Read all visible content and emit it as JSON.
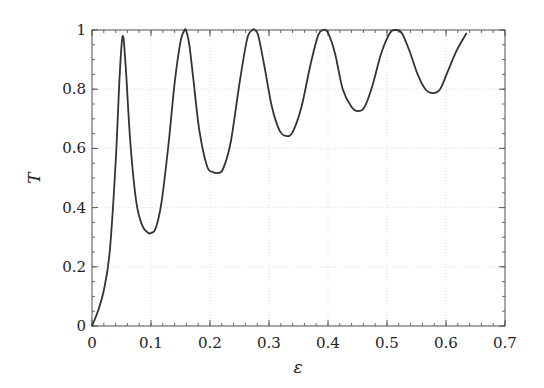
{
  "chart_data": {
    "type": "line",
    "title": "",
    "xlabel": "ε",
    "ylabel": "T",
    "xlim": [
      0,
      0.7
    ],
    "ylim": [
      0,
      1
    ],
    "xticks": [
      0,
      0.1,
      0.2,
      0.3,
      0.4,
      0.5,
      0.6,
      0.7
    ],
    "xtick_labels": [
      "0",
      "0.1",
      "0.2",
      "0.3",
      "0.4",
      "0.5",
      "0.6",
      "0.7"
    ],
    "yticks": [
      0,
      0.2,
      0.4,
      0.6,
      0.8,
      1
    ],
    "ytick_labels": [
      "0",
      "0.2",
      "0.4",
      "0.6",
      "0.8",
      "1"
    ],
    "grid": true,
    "legend": null,
    "series": [
      {
        "name": "T(ε)",
        "color": "#333333",
        "x": [
          0,
          0.01,
          0.02,
          0.03,
          0.04,
          0.047,
          0.052,
          0.057,
          0.065,
          0.075,
          0.085,
          0.095,
          0.1,
          0.108,
          0.118,
          0.13,
          0.14,
          0.15,
          0.157,
          0.16,
          0.165,
          0.172,
          0.182,
          0.195,
          0.205,
          0.213,
          0.222,
          0.235,
          0.25,
          0.263,
          0.272,
          0.276,
          0.282,
          0.292,
          0.305,
          0.318,
          0.329,
          0.34,
          0.355,
          0.37,
          0.383,
          0.392,
          0.4,
          0.412,
          0.425,
          0.44,
          0.451,
          0.462,
          0.475,
          0.49,
          0.505,
          0.515,
          0.525,
          0.538,
          0.552,
          0.565,
          0.578,
          0.59,
          0.603,
          0.618,
          0.635
        ],
        "y": [
          0,
          0.05,
          0.12,
          0.25,
          0.55,
          0.85,
          0.98,
          0.88,
          0.62,
          0.42,
          0.34,
          0.315,
          0.314,
          0.33,
          0.42,
          0.62,
          0.82,
          0.96,
          1.0,
          0.995,
          0.95,
          0.83,
          0.66,
          0.54,
          0.52,
          0.517,
          0.53,
          0.62,
          0.82,
          0.97,
          1.0,
          1.0,
          0.98,
          0.88,
          0.74,
          0.66,
          0.642,
          0.655,
          0.74,
          0.88,
          0.98,
          1.0,
          0.99,
          0.92,
          0.8,
          0.74,
          0.726,
          0.74,
          0.81,
          0.92,
          0.99,
          1.0,
          0.99,
          0.93,
          0.85,
          0.8,
          0.787,
          0.8,
          0.86,
          0.93,
          0.99
        ]
      }
    ]
  }
}
